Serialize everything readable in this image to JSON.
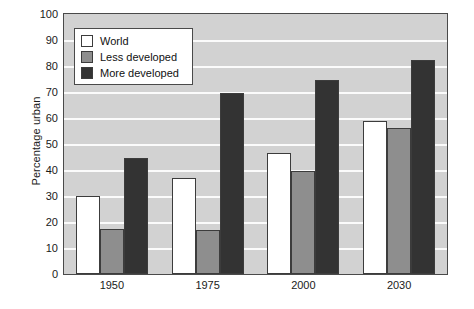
{
  "chart_data": {
    "type": "bar",
    "title": "",
    "subtitle": "",
    "xlabel": "",
    "ylabel": "Percentage urban",
    "categories": [
      "1950",
      "1975",
      "2000",
      "2030"
    ],
    "series": [
      {
        "name": "World",
        "values": [
          30,
          37,
          46.5,
          59
        ],
        "color": "#ffffff"
      },
      {
        "name": "Less developed",
        "values": [
          17.5,
          17,
          39.5,
          56
        ],
        "color": "#8e8e8e"
      },
      {
        "name": "More developed",
        "values": [
          44.5,
          69.5,
          74.5,
          82.5
        ],
        "color": "#333333"
      }
    ],
    "ylim": [
      0,
      100
    ],
    "yticks": [
      0,
      10,
      20,
      30,
      40,
      50,
      60,
      70,
      80,
      90,
      100
    ],
    "ytick_labels": [
      "0",
      "10",
      "20",
      "30",
      "40",
      "50",
      "60",
      "70",
      "80",
      "90",
      "100"
    ],
    "grid": true,
    "grid_color": "#fbfbfb",
    "plot_background": "#d2d2d2",
    "axis_color": "#4a4a4a",
    "legend_position": "upper left",
    "legend_entries": [
      "World",
      "Less developed",
      "More developed"
    ]
  }
}
